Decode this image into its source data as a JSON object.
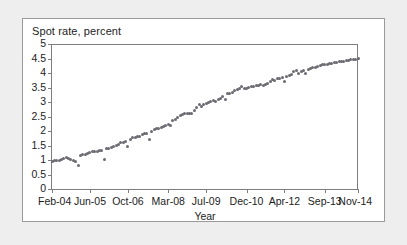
{
  "chart_data": {
    "type": "scatter",
    "title": "Spot rate, percent",
    "xlabel": "Year",
    "ylabel": "",
    "ylim": [
      0,
      5
    ],
    "yticks": [
      0,
      0.5,
      1,
      1.5,
      2,
      2.5,
      3,
      3.5,
      4,
      4.5,
      5
    ],
    "ytick_labels": [
      "0",
      "0.5",
      "1",
      "1.5",
      "2",
      "2.5",
      "3",
      "3.5",
      "4",
      "4.5",
      "5"
    ],
    "grid": false,
    "legend": null,
    "marker_color": "#6b6b72",
    "axis_color": "#7d7d7d",
    "xtick_labels": [
      "Feb-04",
      "Jun-05",
      "Oct-06",
      "Mar-08",
      "Jul-09",
      "Dec-10",
      "Apr-12",
      "Sep-13",
      "Nov-14"
    ],
    "xtick_indices": [
      0,
      16,
      32,
      49,
      65,
      82,
      98,
      115,
      129
    ],
    "x_labels": [
      "Feb-04",
      "Mar-04",
      "Apr-04",
      "May-04",
      "Jun-04",
      "Jul-04",
      "Aug-04",
      "Sep-04",
      "Oct-04",
      "Nov-04",
      "Dec-04",
      "Jan-05",
      "Feb-05",
      "Mar-05",
      "Apr-05",
      "May-05",
      "Jun-05",
      "Jul-05",
      "Aug-05",
      "Sep-05",
      "Oct-05",
      "Nov-05",
      "Dec-05",
      "Jan-06",
      "Feb-06",
      "Mar-06",
      "Apr-06",
      "May-06",
      "Jun-06",
      "Jul-06",
      "Aug-06",
      "Sep-06",
      "Oct-06",
      "Nov-06",
      "Dec-06",
      "Jan-07",
      "Feb-07",
      "Mar-07",
      "Apr-07",
      "May-07",
      "Jun-07",
      "Jul-07",
      "Aug-07",
      "Sep-07",
      "Oct-07",
      "Nov-07",
      "Dec-07",
      "Jan-08",
      "Feb-08",
      "Mar-08",
      "Apr-08",
      "May-08",
      "Jun-08",
      "Jul-08",
      "Aug-08",
      "Sep-08",
      "Oct-08",
      "Nov-08",
      "Dec-08",
      "Jan-09",
      "Feb-09",
      "Mar-09",
      "Apr-09",
      "May-09",
      "Jun-09",
      "Jul-09",
      "Aug-09",
      "Sep-09",
      "Oct-09",
      "Nov-09",
      "Dec-09",
      "Jan-10",
      "Feb-10",
      "Mar-10",
      "Apr-10",
      "May-10",
      "Jun-10",
      "Jul-10",
      "Aug-10",
      "Sep-10",
      "Oct-10",
      "Nov-10",
      "Dec-10",
      "Jan-11",
      "Feb-11",
      "Mar-11",
      "Apr-11",
      "May-11",
      "Jun-11",
      "Jul-11",
      "Aug-11",
      "Sep-11",
      "Oct-11",
      "Nov-11",
      "Dec-11",
      "Jan-12",
      "Feb-12",
      "Mar-12",
      "Apr-12",
      "May-12",
      "Jun-12",
      "Jul-12",
      "Aug-12",
      "Sep-12",
      "Oct-12",
      "Nov-12",
      "Dec-12",
      "Jan-13",
      "Feb-13",
      "Mar-13",
      "Apr-13",
      "May-13",
      "Jun-13",
      "Jul-13",
      "Aug-13",
      "Sep-13",
      "Oct-13",
      "Nov-13",
      "Dec-13",
      "Jan-14",
      "Feb-14",
      "Mar-14",
      "Apr-14",
      "May-14",
      "Jun-14",
      "Jul-14",
      "Aug-14",
      "Sep-14",
      "Oct-14",
      "Nov-14"
    ],
    "values": [
      0.95,
      1.0,
      1.0,
      1.0,
      1.02,
      1.05,
      1.08,
      1.05,
      1.02,
      1.0,
      0.95,
      0.8,
      1.15,
      1.18,
      1.2,
      1.22,
      1.25,
      1.28,
      1.3,
      1.3,
      1.32,
      1.33,
      1.02,
      1.38,
      1.4,
      1.42,
      1.48,
      1.5,
      1.52,
      1.62,
      1.62,
      1.63,
      1.45,
      1.72,
      1.78,
      1.78,
      1.8,
      1.82,
      1.88,
      1.9,
      1.92,
      1.7,
      2.0,
      2.05,
      2.08,
      2.1,
      2.12,
      2.15,
      2.18,
      2.22,
      2.2,
      2.35,
      2.4,
      2.45,
      2.52,
      2.58,
      2.6,
      2.62,
      2.62,
      2.6,
      2.72,
      2.8,
      2.9,
      2.85,
      2.92,
      2.95,
      3.0,
      3.02,
      3.05,
      3.02,
      3.08,
      3.12,
      3.2,
      3.1,
      3.28,
      3.3,
      3.32,
      3.38,
      3.42,
      3.48,
      3.52,
      3.48,
      3.46,
      3.5,
      3.55,
      3.55,
      3.58,
      3.58,
      3.6,
      3.58,
      3.62,
      3.65,
      3.72,
      3.78,
      3.75,
      3.8,
      3.82,
      3.85,
      3.72,
      3.88,
      3.92,
      3.95,
      4.05,
      4.08,
      3.98,
      4.05,
      4.08,
      4.0,
      4.12,
      4.15,
      4.18,
      4.2,
      4.22,
      4.25,
      4.28,
      4.3,
      4.3,
      4.32,
      4.34,
      4.35,
      4.36,
      4.38,
      4.4,
      4.4,
      4.42,
      4.44,
      4.45,
      4.46,
      4.48,
      4.5
    ]
  }
}
